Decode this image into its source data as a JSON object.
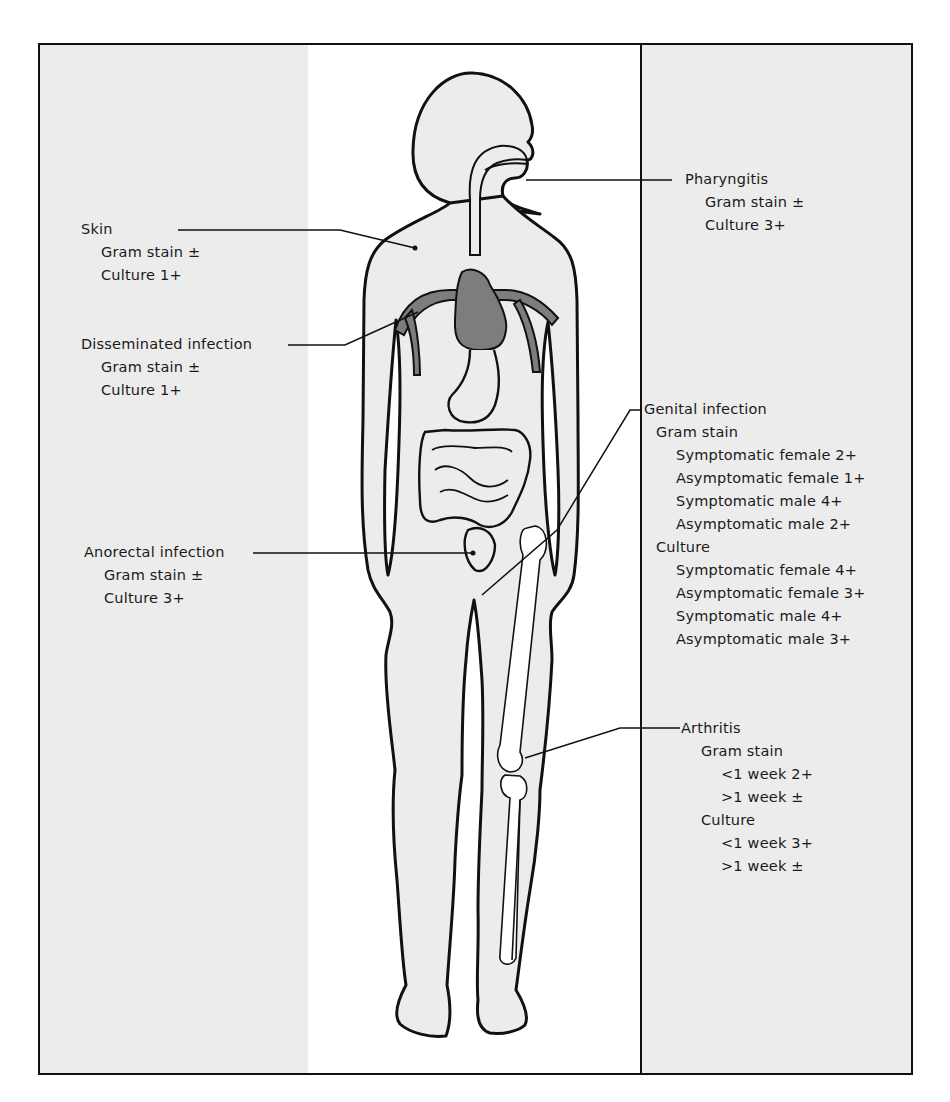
{
  "colors": {
    "side_panel": "#ececec",
    "center_panel": "#ffffff",
    "body_fill": "#ececec",
    "heart_vessels": "#7d7d7d",
    "outline": "#111111"
  },
  "labels": {
    "skin": {
      "title": "Skin",
      "gram_stain": "Gram stain ±",
      "culture": "Culture 1+"
    },
    "disseminated": {
      "title": "Disseminated infection",
      "gram_stain": "Gram stain ±",
      "culture": "Culture 1+"
    },
    "anorectal": {
      "title": "Anorectal infection",
      "gram_stain": "Gram stain ±",
      "culture": "Culture 3+"
    },
    "pharyngitis": {
      "title": "Pharyngitis",
      "gram_stain": "Gram stain ±",
      "culture": "Culture 3+"
    },
    "genital": {
      "title": "Genital infection",
      "gram_stain_heading": "Gram stain",
      "gram_stain": [
        "Symptomatic female 2+",
        "Asymptomatic female 1+",
        "Symptomatic male 4+",
        "Asymptomatic male 2+"
      ],
      "culture_heading": "Culture",
      "culture": [
        "Symptomatic female 4+",
        "Asymptomatic female 3+",
        "Symptomatic male 4+",
        "Asymptomatic male 3+"
      ]
    },
    "arthritis": {
      "title": "Arthritis",
      "gram_stain_heading": "Gram stain",
      "gram_stain": [
        "<1 week 2+",
        ">1 week ±"
      ],
      "culture_heading": "Culture",
      "culture": [
        "<1 week 3+",
        ">1 week ±"
      ]
    }
  }
}
